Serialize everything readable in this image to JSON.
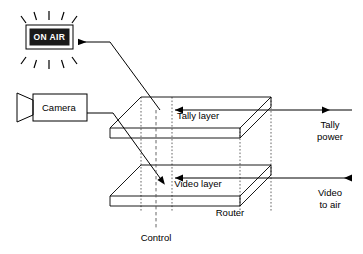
{
  "diagram": {
    "background_color": "#ffffff",
    "line_color": "#000000",
    "accent_color": "#000000"
  },
  "on_air_sign": {
    "label": "ON AIR",
    "body_color": "#1a1a1a",
    "text_color": "#ffffff",
    "ray_count_top": 5,
    "ray_count_bottom": 5
  },
  "camera": {
    "label": "Camera"
  },
  "router": {
    "label": "Router",
    "layers": [
      {
        "id": "tally",
        "label": "Tally layer"
      },
      {
        "id": "video",
        "label": "Video layer"
      }
    ],
    "control_label": "Control"
  },
  "ports": {
    "tally_power": {
      "line1": "Tally",
      "line2": "power",
      "direction": "input-left-arrow"
    },
    "video_to_air": {
      "line1": "Video",
      "line2": "to air",
      "direction": "output-right-arrow"
    }
  },
  "icons": {
    "arrow_left": "arrow-left-icon",
    "arrow_right": "arrow-right-icon",
    "camera_lens": "camera-lens-icon",
    "light_rays": "light-rays-icon"
  }
}
